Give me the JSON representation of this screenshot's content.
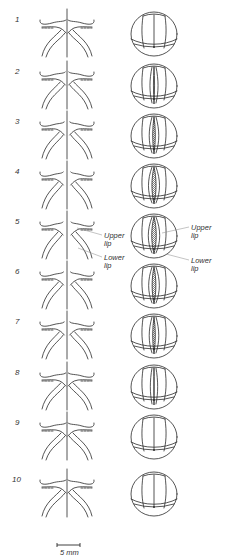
{
  "figure": {
    "colors": {
      "stroke": "#2a2a2a",
      "background": "#ffffff",
      "annotation_line": "#888888"
    },
    "rows": [
      {
        "label": "1",
        "y": 20,
        "opening": 0.0,
        "stage": "closed"
      },
      {
        "label": "2",
        "y": 72,
        "opening": 0.15,
        "stage": "opening"
      },
      {
        "label": "3",
        "y": 122,
        "opening": 0.35,
        "stage": "opening"
      },
      {
        "label": "4",
        "y": 172,
        "opening": 0.55,
        "stage": "open"
      },
      {
        "label": "5",
        "y": 222,
        "opening": 0.6,
        "stage": "open"
      },
      {
        "label": "6",
        "y": 272,
        "opening": 0.5,
        "stage": "closing"
      },
      {
        "label": "7",
        "y": 322,
        "opening": 0.35,
        "stage": "closing"
      },
      {
        "label": "8",
        "y": 373,
        "opening": 0.05,
        "stage": "closed"
      },
      {
        "label": "9",
        "y": 423,
        "opening": 0.0,
        "stage": "closed"
      },
      {
        "label": "10",
        "y": 480,
        "opening": 0.0,
        "stage": "closed"
      }
    ],
    "annotations": {
      "left_upper": {
        "line1": "Upper",
        "line2": "lip"
      },
      "left_lower": {
        "line1": "Lower",
        "line2": "lip"
      },
      "right_upper": {
        "line1": "Upper",
        "line2": "lip"
      },
      "right_lower": {
        "line1": "Lower",
        "line2": "lip"
      }
    },
    "scale_bar": {
      "label": "5 mm",
      "x1": 57,
      "x2": 80,
      "y": 545
    }
  }
}
